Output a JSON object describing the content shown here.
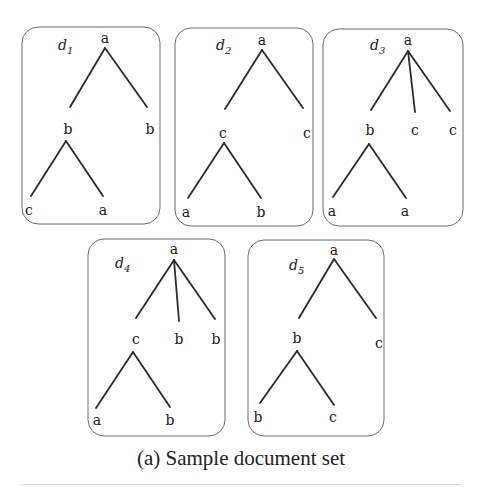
{
  "figure": {
    "caption": "(a) Sample document set",
    "colors": {
      "stroke": "#2a2a2a",
      "box": "#6a6a6a",
      "text": "#1a1a1a"
    },
    "documents": [
      {
        "id": "d1",
        "label": "d",
        "subscript": "1",
        "box": {
          "x": 22,
          "y": 27,
          "w": 138,
          "h": 197
        },
        "label_pos": {
          "x": 58,
          "y": 50
        },
        "nodes": [
          {
            "id": "n0",
            "text": "a",
            "x": 105,
            "y": 38
          },
          {
            "id": "n1",
            "text": "b",
            "x": 68,
            "y": 129
          },
          {
            "id": "n2",
            "text": "b",
            "x": 150,
            "y": 129
          },
          {
            "id": "n3",
            "text": "c",
            "x": 29,
            "y": 210
          },
          {
            "id": "n4",
            "text": "a",
            "x": 103,
            "y": 210
          }
        ],
        "edges": [
          {
            "x1": 105,
            "y1": 48,
            "x2": 70,
            "y2": 107
          },
          {
            "x1": 105,
            "y1": 48,
            "x2": 147,
            "y2": 107
          },
          {
            "x1": 66,
            "y1": 141,
            "x2": 31,
            "y2": 196
          },
          {
            "x1": 66,
            "y1": 141,
            "x2": 103,
            "y2": 196
          }
        ]
      },
      {
        "id": "d2",
        "label": "d",
        "subscript": "2",
        "box": {
          "x": 175,
          "y": 28,
          "w": 138,
          "h": 198
        },
        "label_pos": {
          "x": 216,
          "y": 50
        },
        "nodes": [
          {
            "id": "n0",
            "text": "a",
            "x": 262,
            "y": 40
          },
          {
            "id": "n1",
            "text": "c",
            "x": 223,
            "y": 133
          },
          {
            "id": "n2",
            "text": "c",
            "x": 307,
            "y": 133
          },
          {
            "id": "n3",
            "text": "a",
            "x": 186,
            "y": 212
          },
          {
            "id": "n4",
            "text": "b",
            "x": 261,
            "y": 212
          }
        ],
        "edges": [
          {
            "x1": 262,
            "y1": 50,
            "x2": 225,
            "y2": 109
          },
          {
            "x1": 262,
            "y1": 50,
            "x2": 303,
            "y2": 108
          },
          {
            "x1": 224,
            "y1": 143,
            "x2": 188,
            "y2": 198
          },
          {
            "x1": 224,
            "y1": 143,
            "x2": 261,
            "y2": 198
          }
        ]
      },
      {
        "id": "d3",
        "label": "d",
        "subscript": "3",
        "box": {
          "x": 323,
          "y": 29,
          "w": 140,
          "h": 197
        },
        "label_pos": {
          "x": 370,
          "y": 50
        },
        "nodes": [
          {
            "id": "n0",
            "text": "a",
            "x": 408,
            "y": 40
          },
          {
            "id": "n1",
            "text": "b",
            "x": 370,
            "y": 130
          },
          {
            "id": "n2",
            "text": "c",
            "x": 415,
            "y": 130
          },
          {
            "id": "n3",
            "text": "c",
            "x": 453,
            "y": 130
          },
          {
            "id": "n4",
            "text": "a",
            "x": 332,
            "y": 211
          },
          {
            "id": "n5",
            "text": "a",
            "x": 405,
            "y": 211
          }
        ],
        "edges": [
          {
            "x1": 408,
            "y1": 51,
            "x2": 371,
            "y2": 110
          },
          {
            "x1": 408,
            "y1": 51,
            "x2": 415,
            "y2": 112
          },
          {
            "x1": 408,
            "y1": 51,
            "x2": 450,
            "y2": 111
          },
          {
            "x1": 369,
            "y1": 144,
            "x2": 333,
            "y2": 197
          },
          {
            "x1": 369,
            "y1": 144,
            "x2": 406,
            "y2": 198
          }
        ]
      },
      {
        "id": "d4",
        "label": "d",
        "subscript": "4",
        "box": {
          "x": 88,
          "y": 239,
          "w": 137,
          "h": 197
        },
        "label_pos": {
          "x": 115,
          "y": 268
        },
        "nodes": [
          {
            "id": "n0",
            "text": "a",
            "x": 174,
            "y": 249
          },
          {
            "id": "n1",
            "text": "c",
            "x": 136,
            "y": 339
          },
          {
            "id": "n2",
            "text": "b",
            "x": 179,
            "y": 339
          },
          {
            "id": "n3",
            "text": "b",
            "x": 216,
            "y": 339
          },
          {
            "id": "n4",
            "text": "a",
            "x": 97,
            "y": 420
          },
          {
            "id": "n5",
            "text": "b",
            "x": 170,
            "y": 420
          }
        ],
        "edges": [
          {
            "x1": 174,
            "y1": 260,
            "x2": 136,
            "y2": 318
          },
          {
            "x1": 174,
            "y1": 260,
            "x2": 179,
            "y2": 321
          },
          {
            "x1": 174,
            "y1": 260,
            "x2": 215,
            "y2": 319
          },
          {
            "x1": 133,
            "y1": 352,
            "x2": 96,
            "y2": 408
          },
          {
            "x1": 133,
            "y1": 352,
            "x2": 170,
            "y2": 407
          }
        ]
      },
      {
        "id": "d5",
        "label": "d",
        "subscript": "5",
        "box": {
          "x": 248,
          "y": 240,
          "w": 136,
          "h": 196
        },
        "label_pos": {
          "x": 289,
          "y": 270
        },
        "nodes": [
          {
            "id": "n0",
            "text": "a",
            "x": 334,
            "y": 250
          },
          {
            "id": "n1",
            "text": "b",
            "x": 297,
            "y": 338
          },
          {
            "id": "n2",
            "text": "c",
            "x": 379,
            "y": 343
          },
          {
            "id": "n3",
            "text": "b",
            "x": 258,
            "y": 417
          },
          {
            "id": "n4",
            "text": "c",
            "x": 333,
            "y": 417
          }
        ],
        "edges": [
          {
            "x1": 334,
            "y1": 259,
            "x2": 299,
            "y2": 318
          },
          {
            "x1": 334,
            "y1": 259,
            "x2": 376,
            "y2": 318
          },
          {
            "x1": 297,
            "y1": 351,
            "x2": 260,
            "y2": 403
          },
          {
            "x1": 297,
            "y1": 351,
            "x2": 334,
            "y2": 405
          }
        ]
      }
    ]
  }
}
